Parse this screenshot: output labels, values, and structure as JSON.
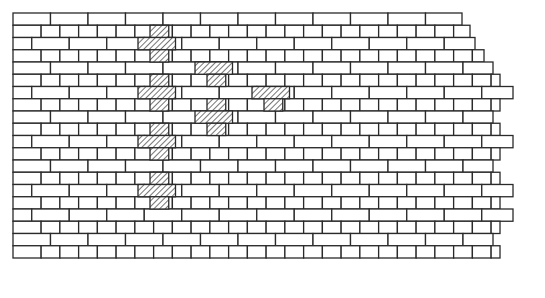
{
  "diagram": {
    "type": "brick-wall-elevation",
    "colors": {
      "line": "#2a2a2a",
      "brick_fill": "#ffffff",
      "hatch": "#3a3a3a",
      "background": "#ffffff"
    },
    "geometry": {
      "left_x": 13,
      "top_y": 13,
      "row_height": 12.25,
      "stretcher_width": 37.5,
      "header_width": 18.75
    },
    "rows": [
      {
        "type": "stretcher",
        "offset": 0,
        "right_x": 462
      },
      {
        "type": "header",
        "offset": 0,
        "right_x": 470
      },
      {
        "type": "stretcher",
        "offset": 18.75,
        "right_x": 475
      },
      {
        "type": "header",
        "offset": 0,
        "right_x": 484
      },
      {
        "type": "stretcher",
        "offset": 0,
        "right_x": 493
      },
      {
        "type": "header",
        "offset": 0,
        "right_x": 500
      },
      {
        "type": "stretcher",
        "offset": 18.75,
        "right_x": 513
      },
      {
        "type": "header",
        "offset": 0,
        "right_x": 500
      },
      {
        "type": "stretcher",
        "offset": 0,
        "right_x": 493
      },
      {
        "type": "header",
        "offset": 0,
        "right_x": 500
      },
      {
        "type": "stretcher",
        "offset": 18.75,
        "right_x": 513
      },
      {
        "type": "header",
        "offset": 0,
        "right_x": 500
      },
      {
        "type": "stretcher",
        "offset": 0,
        "right_x": 493
      },
      {
        "type": "header",
        "offset": 0,
        "right_x": 500
      },
      {
        "type": "stretcher",
        "offset": 18.75,
        "right_x": 513
      },
      {
        "type": "header",
        "offset": 0,
        "right_x": 500
      },
      {
        "type": "stretcher",
        "offset": 18.75,
        "right_x": 513
      },
      {
        "type": "header",
        "offset": 0,
        "right_x": 500
      },
      {
        "type": "stretcher",
        "offset": 0,
        "right_x": 493
      },
      {
        "type": "header",
        "offset": 0,
        "right_x": 500
      }
    ],
    "hatched_bricks": [
      {
        "row": 1,
        "x": 150,
        "w": 18.75
      },
      {
        "row": 2,
        "x": 138,
        "w": 37.5
      },
      {
        "row": 3,
        "x": 150,
        "w": 18.75
      },
      {
        "row": 4,
        "x": 195,
        "w": 37.5
      },
      {
        "row": 5,
        "x": 150,
        "w": 18.75
      },
      {
        "row": 5,
        "x": 207,
        "w": 18.75
      },
      {
        "row": 6,
        "x": 138,
        "w": 37.5
      },
      {
        "row": 6,
        "x": 252,
        "w": 37.5
      },
      {
        "row": 7,
        "x": 150,
        "w": 18.75
      },
      {
        "row": 7,
        "x": 207,
        "w": 18.75
      },
      {
        "row": 7,
        "x": 264,
        "w": 18.75
      },
      {
        "row": 8,
        "x": 195,
        "w": 37.5
      },
      {
        "row": 9,
        "x": 150,
        "w": 18.75
      },
      {
        "row": 9,
        "x": 207,
        "w": 18.75
      },
      {
        "row": 10,
        "x": 138,
        "w": 37.5
      },
      {
        "row": 11,
        "x": 150,
        "w": 18.75
      },
      {
        "row": 13,
        "x": 150,
        "w": 18.75
      },
      {
        "row": 14,
        "x": 138,
        "w": 37.5
      },
      {
        "row": 15,
        "x": 150,
        "w": 18.75
      }
    ]
  }
}
